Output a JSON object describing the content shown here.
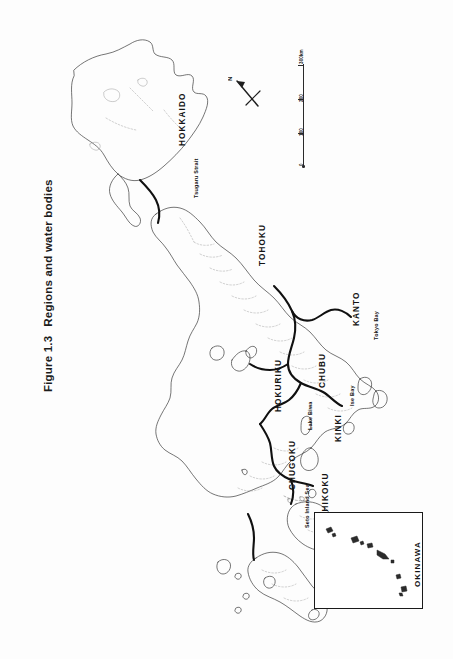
{
  "caption": {
    "number": "Figure 1.3",
    "text": "Regions and water bodies"
  },
  "map": {
    "title": "Regions and water bodies of Japan",
    "orientation": "rotated 90 degrees counter-clockwise (page is landscape map on portrait page)",
    "regions": [
      {
        "label": "HOKKAIDO",
        "x": 118,
        "y": 128
      },
      {
        "label": "TOHOKU",
        "x": 198,
        "y": 248
      },
      {
        "label": "KANTO",
        "x": 292,
        "y": 308
      },
      {
        "label": "CHUBU",
        "x": 258,
        "y": 370
      },
      {
        "label": "HOKURIKU",
        "x": 214,
        "y": 394
      },
      {
        "label": "KINKI",
        "x": 274,
        "y": 424
      },
      {
        "label": "CHUGOKU",
        "x": 228,
        "y": 472
      },
      {
        "label": "SHIKOKU",
        "x": 261,
        "y": 500
      },
      {
        "label": "KYUSHU",
        "x": 268,
        "y": 588
      }
    ],
    "water_bodies": [
      {
        "label": "Tsugaru Strait",
        "x": 133,
        "y": 180
      },
      {
        "label": "Tokyo Bay",
        "x": 313,
        "y": 322
      },
      {
        "label": "Ise Bay",
        "x": 289,
        "y": 388
      },
      {
        "label": "Lake Biwa",
        "x": 247,
        "y": 412
      },
      {
        "label": "Seto Inland Sea",
        "x": 244,
        "y": 510
      }
    ],
    "inset": {
      "label": "OKINAWA"
    },
    "compass": {
      "label": "N"
    },
    "scale_bar": {
      "unit": "km",
      "ticks": [
        "300km",
        "200",
        "100",
        "0"
      ]
    },
    "colors": {
      "coastline": "#3a3a3a",
      "region_boundary": "#111111",
      "prefecture_boundary": "#8c8c8c",
      "text": "#141414",
      "background": "#ffffff"
    }
  }
}
